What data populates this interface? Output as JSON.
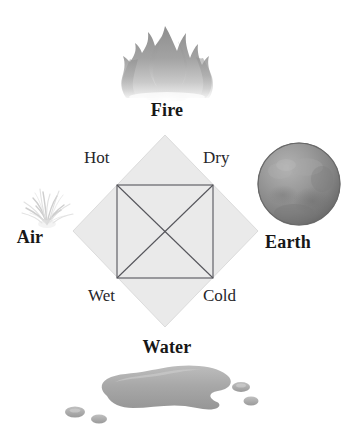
{
  "diagram": {
    "elements": [
      {
        "key": "fire",
        "label": "Fire",
        "icon": "flame-icon",
        "position": "top"
      },
      {
        "key": "earth",
        "label": "Earth",
        "icon": "sphere-icon",
        "position": "right"
      },
      {
        "key": "water",
        "label": "Water",
        "icon": "puddle-icon",
        "position": "bottom"
      },
      {
        "key": "air",
        "label": "Air",
        "icon": "wisp-icon",
        "position": "left"
      }
    ],
    "qualities": [
      {
        "key": "hot",
        "label": "Hot",
        "corner": "top-left"
      },
      {
        "key": "dry",
        "label": "Dry",
        "corner": "top-right"
      },
      {
        "key": "wet",
        "label": "Wet",
        "corner": "bottom-left"
      },
      {
        "key": "cold",
        "label": "Cold",
        "corner": "bottom-right"
      }
    ],
    "shapes": {
      "diamond_fill": "#eaeaea",
      "diamond_stroke": "#d8d8d8",
      "square_stroke": "#54545a",
      "diagonal_stroke": "#54545a"
    },
    "colors": {
      "background": "#ffffff",
      "text": "#171717",
      "quality_text": "#26262a",
      "fire_gray": "#9a9a9a",
      "earth_gray": "#8f8f8f",
      "air_gray": "#cfcfcf",
      "water_gray": "#a6a6a6"
    }
  }
}
